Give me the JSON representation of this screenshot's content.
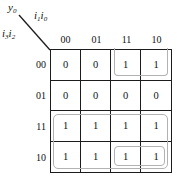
{
  "labels": {
    "output": {
      "base": "y",
      "sub": "0"
    },
    "col_axis": {
      "base_a": "i",
      "sub_a": "1",
      "base_b": "i",
      "sub_b": "0"
    },
    "row_axis": {
      "base_a": "i",
      "sub_a": "3",
      "base_b": "i",
      "sub_b": "2"
    }
  },
  "kmap": {
    "col_headers": [
      "00",
      "01",
      "11",
      "10"
    ],
    "row_headers": [
      "00",
      "01",
      "11",
      "10"
    ],
    "cells": [
      [
        "0",
        "0",
        "1",
        "1"
      ],
      [
        "0",
        "0",
        "0",
        "0"
      ],
      [
        "1",
        "1",
        "1",
        "1"
      ],
      [
        "1",
        "1",
        "1",
        "1"
      ]
    ],
    "groups": [
      {
        "id": "top-wrap-pair",
        "cells": [
          "r00c11",
          "r00c10"
        ],
        "open_edge": "top"
      },
      {
        "id": "rows-11-10-octet",
        "cells": [
          "r11c00",
          "r11c01",
          "r11c11",
          "r11c10",
          "r10c00",
          "r10c01",
          "r10c11",
          "r10c10"
        ],
        "open_edge": "none"
      },
      {
        "id": "bottom-right-pair",
        "cells": [
          "r10c11",
          "r10c10"
        ],
        "open_edge": "none"
      }
    ]
  },
  "colors": {
    "grid_line": "#1c1c1c",
    "group_outline": "#b2b2b2",
    "text": "#111111",
    "background": "#ffffff"
  }
}
